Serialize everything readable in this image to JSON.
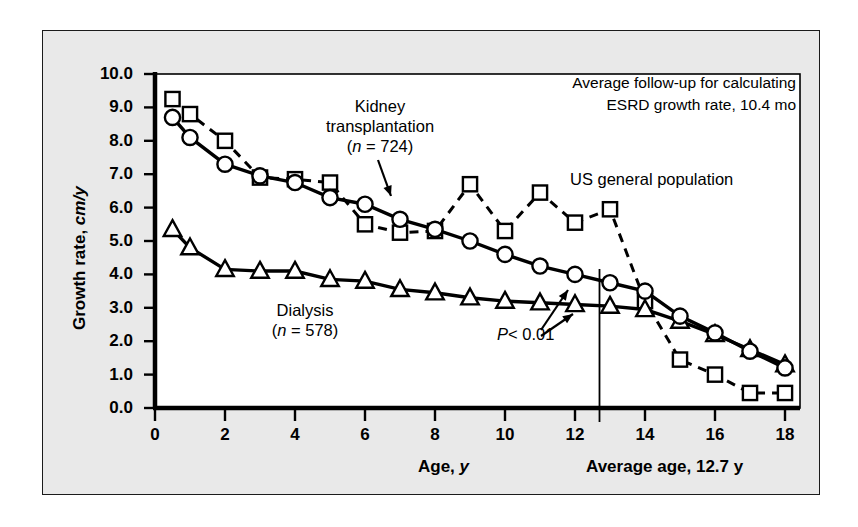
{
  "figure": {
    "background": "#e9e9e9",
    "plot_background": "#ffffff",
    "ink": "#000000"
  },
  "labels": {
    "y_axis_main": "Growth rate, ",
    "y_axis_units": "cm/y",
    "x_axis_main": "Age, ",
    "x_axis_units": "y",
    "average_age": "Average age, 12.7 y",
    "followup_line1": "Average follow-up for calculating",
    "followup_line2": "ESRD growth rate, 10.4 mo",
    "kidney_line1": "Kidney",
    "kidney_line2": "transplantation",
    "kidney_n_prefix": "(",
    "kidney_n_italic": "n",
    "kidney_n_rest": " = 724)",
    "dialysis_line1": "Dialysis",
    "dialysis_n_prefix": "(",
    "dialysis_n_italic": "n",
    "dialysis_n_rest": " = 578)",
    "us_population": "US general population",
    "pvalue_italic": "P",
    "pvalue_rest": "< 0.01"
  },
  "chart_data": {
    "type": "line",
    "title": "",
    "xlabel": "Age, y",
    "ylabel": "Growth rate, cm/y",
    "xlim": [
      0,
      18
    ],
    "ylim": [
      0,
      10
    ],
    "xticks": [
      0,
      2,
      4,
      6,
      8,
      10,
      12,
      14,
      16,
      18
    ],
    "yticks": [
      0.0,
      1.0,
      2.0,
      3.0,
      4.0,
      5.0,
      6.0,
      7.0,
      8.0,
      9.0,
      10.0
    ],
    "ytick_labels": [
      "0.0",
      "1.0",
      "2.0",
      "3.0",
      "4.0",
      "5.0",
      "6.0",
      "7.0",
      "8.0",
      "9.0",
      "10.0"
    ],
    "xtick_labels": [
      "0",
      "2",
      "4",
      "6",
      "8",
      "10",
      "12",
      "14",
      "16",
      "18"
    ],
    "xminor_ticks": [
      1,
      3,
      5,
      7,
      9,
      11,
      13,
      15,
      17
    ],
    "grid": false,
    "legend_position": "inline-annotations",
    "vertical_reference_line": {
      "x": 12.7,
      "label": "Average age, 12.7 y"
    },
    "series": [
      {
        "name": "Kidney transplantation",
        "n": 724,
        "marker": "circle",
        "line": "solid",
        "x": [
          0.5,
          1,
          2,
          3,
          4,
          5,
          6,
          7,
          8,
          9,
          10,
          11,
          12,
          13,
          14,
          15,
          16,
          17,
          18
        ],
        "values": [
          8.7,
          8.1,
          7.3,
          6.95,
          6.75,
          6.3,
          6.1,
          5.65,
          5.35,
          5.0,
          4.6,
          4.25,
          4.0,
          3.75,
          3.5,
          2.75,
          2.25,
          1.7,
          1.2
        ]
      },
      {
        "name": "US general population",
        "marker": "square",
        "line": "dashed",
        "x": [
          0.5,
          1,
          2,
          3,
          4,
          5,
          6,
          7,
          8,
          9,
          10,
          11,
          12,
          13,
          14,
          15,
          16,
          17,
          18
        ],
        "values": [
          9.25,
          8.8,
          8.0,
          6.9,
          6.85,
          6.75,
          5.5,
          5.25,
          5.3,
          6.7,
          5.3,
          6.45,
          5.55,
          5.95,
          3.2,
          1.45,
          1.0,
          0.45,
          0.45
        ]
      },
      {
        "name": "Dialysis",
        "n": 578,
        "marker": "triangle",
        "line": "solid",
        "x": [
          0.5,
          1,
          2,
          3,
          4,
          5,
          6,
          7,
          8,
          9,
          10,
          11,
          12,
          13,
          14,
          15,
          16,
          17,
          18
        ],
        "values": [
          5.35,
          4.8,
          4.15,
          4.1,
          4.1,
          3.85,
          3.8,
          3.55,
          3.45,
          3.3,
          3.2,
          3.15,
          3.1,
          3.05,
          2.95,
          2.6,
          2.2,
          1.75,
          1.3
        ]
      }
    ],
    "annotations": [
      {
        "text": "P< 0.01",
        "note": "two arrows pointing to kidney transplantation and dialysis curves near age 12"
      },
      {
        "text": "Average follow-up for calculating ESRD growth rate, 10.4 mo"
      }
    ]
  }
}
